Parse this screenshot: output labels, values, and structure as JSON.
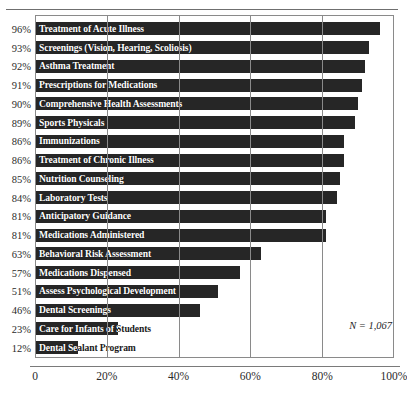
{
  "figure": {
    "cropped_title_fragment": "g",
    "top_rule": true
  },
  "annotations": {
    "sample_size": "N = 1,067"
  },
  "colors": {
    "bar": "#262626",
    "bar_label_text": "#ffffff",
    "grid": "#8a8a8a",
    "axis_text": "#2a2a2a",
    "background": "#ffffff"
  },
  "chart_data": {
    "type": "bar",
    "orientation": "horizontal",
    "title": "",
    "subtitle": "",
    "xlabel": "",
    "ylabel": "",
    "xlim": [
      0,
      100
    ],
    "grid": true,
    "gridlines_at": [
      0,
      20,
      40,
      60,
      80,
      100
    ],
    "legend": null,
    "legend_position": "none",
    "xtick_labels": [
      "0",
      "20%",
      "40%",
      "60%",
      "80%",
      "100%"
    ],
    "xtick_values": [
      0,
      20,
      40,
      60,
      80,
      100
    ],
    "value_suffix": "%",
    "categories": [
      "Treatment of Acute Illness",
      "Screenings (Vision, Hearing, Scoliosis)",
      "Asthma Treatment",
      "Prescriptions for Medications",
      "Comprehensive Health Assessments",
      "Sports Physicals",
      "Immunizations",
      "Treatment of Chronic Illness",
      "Nutrition Counseling",
      "Laboratory Tests",
      "Anticipatory Guidance",
      "Medications Administered",
      "Behavioral Risk Assessment",
      "Medications Dispensed",
      "Assess Psychological Development",
      "Dental Screenings",
      "Care for Infants of Students",
      "Dental Sealant Program"
    ],
    "values": [
      96,
      93,
      92,
      91,
      90,
      89,
      86,
      86,
      85,
      84,
      81,
      81,
      63,
      57,
      51,
      46,
      23,
      12
    ],
    "value_labels": [
      "96%",
      "93%",
      "92%",
      "91%",
      "90%",
      "89%",
      "86%",
      "86%",
      "85%",
      "84%",
      "81%",
      "81%",
      "63%",
      "57%",
      "51%",
      "46%",
      "23%",
      "12%"
    ]
  }
}
